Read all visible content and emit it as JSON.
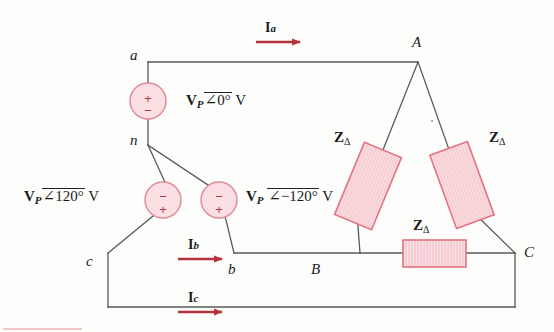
{
  "figure": {
    "type": "circuit-schematic",
    "colors": {
      "wire": "#5a5a5a",
      "arrow_red": "#b5333f",
      "source_fill": "#fbdfe3",
      "source_stroke": "#e08d98",
      "impedance_fill": "#fae0e4",
      "impedance_stroke": "#e4737f",
      "text": "#1a1a1a",
      "background": "#fdfdfb",
      "footer_rule": "#f3c3c6"
    }
  },
  "source_nodes": {
    "a": "a",
    "n": "n",
    "b": "b",
    "c": "c"
  },
  "load_vertices": {
    "A": "A",
    "B": "B",
    "C": "C"
  },
  "sources": [
    {
      "id": "source-a",
      "label_v": "V",
      "label_sub": "P",
      "angle": "0°",
      "unit": "V",
      "full_label": "V_P ∠0° V",
      "plus_top": true,
      "top_sign": "+",
      "bottom_sign": "−"
    },
    {
      "id": "source-c",
      "label_v": "V",
      "label_sub": "P",
      "angle": "120°",
      "unit": "V",
      "full_label": "V_P ∠120° V",
      "plus_top": false,
      "top_sign": "−",
      "bottom_sign": "+"
    },
    {
      "id": "source-b",
      "label_v": "V",
      "label_sub": "P",
      "angle": "−120°",
      "unit": "V",
      "full_label": "V_P ∠−120° V",
      "plus_top": false,
      "top_sign": "−",
      "bottom_sign": "+"
    }
  ],
  "currents": [
    {
      "id": "current-a",
      "symbol": "I",
      "sub": "a"
    },
    {
      "id": "current-b",
      "symbol": "I",
      "sub": "b"
    },
    {
      "id": "current-c",
      "symbol": "I",
      "sub": "c"
    }
  ],
  "impedances": [
    {
      "id": "z-delta-ab",
      "symbol": "Z",
      "sub": "Δ",
      "position": "left-leg"
    },
    {
      "id": "z-delta-ca",
      "symbol": "Z",
      "sub": "Δ",
      "position": "right-leg"
    },
    {
      "id": "z-delta-bc",
      "symbol": "Z",
      "sub": "Δ",
      "position": "bottom-leg"
    }
  ],
  "angle_glyph": "∠"
}
